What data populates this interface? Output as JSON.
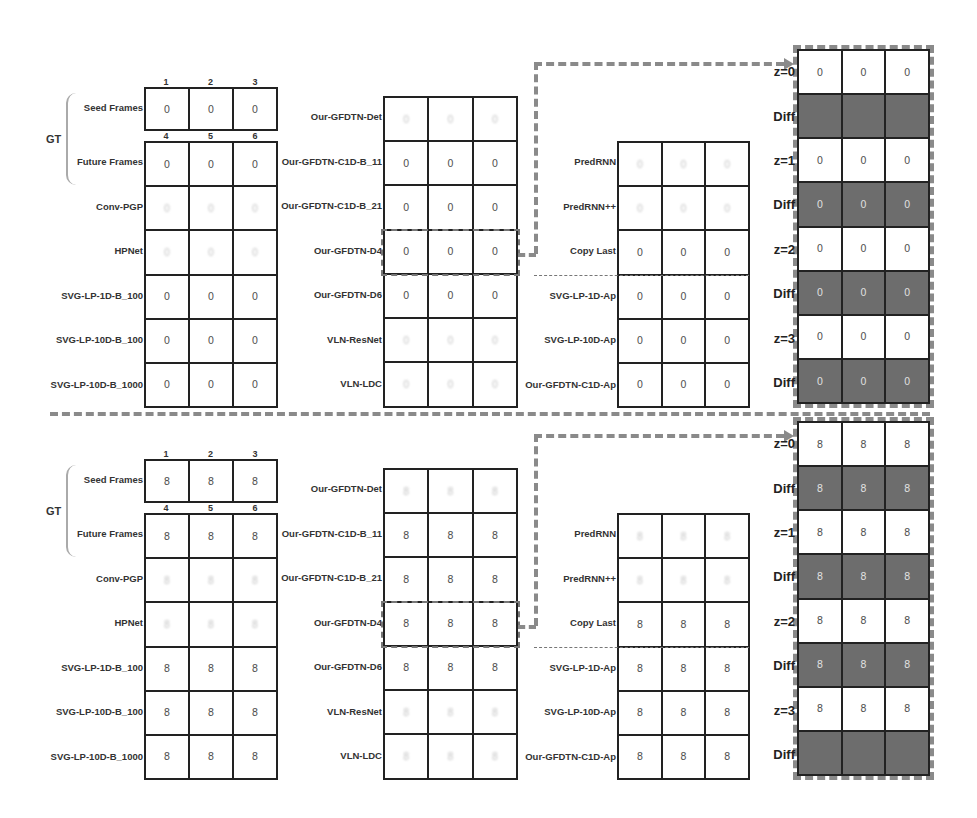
{
  "figure": {
    "column_numbers": {
      "seed": [
        "1",
        "2",
        "3"
      ],
      "future": [
        "4",
        "5",
        "6"
      ]
    },
    "gt_label": "GT",
    "accent_colors": {
      "grid_border": "#222222",
      "diff_cell": "#6d6d6d",
      "dashed": "#8a8a8a"
    }
  },
  "top_panel": {
    "digit": "0",
    "left_rows": [
      "Seed Frames",
      "Future Frames",
      "Conv-PGP",
      "HPNet",
      "SVG-LP-1D-B_100",
      "SVG-LP-10D-B_100",
      "SVG-LP-10D-B_1000"
    ],
    "middle_rows": [
      "Our-GFDTN-Det",
      "Our-GFDTN-C1D-B_11",
      "Our-GFDTN-C1D-B_21",
      "Our-GFDTN-D4",
      "Our-GFDTN-D6",
      "VLN-ResNet",
      "VLN-LDC"
    ],
    "right_rows": [
      "PredRNN",
      "PredRNN++",
      "Copy Last",
      "SVG-LP-1D-Ap",
      "SVG-LP-10D-Ap",
      "Our-GFDTN-C1D-Ap"
    ],
    "far_right_rows": [
      "z=0",
      "Diff",
      "z=1",
      "Diff",
      "z=2",
      "Diff",
      "z=3",
      "Diff"
    ]
  },
  "bottom_panel": {
    "digit": "8",
    "left_rows": [
      "Seed Frames",
      "Future Frames",
      "Conv-PGP",
      "HPNet",
      "SVG-LP-1D-B_100",
      "SVG-LP-10D-B_100",
      "SVG-LP-10D-B_1000"
    ],
    "middle_rows": [
      "Our-GFDTN-Det",
      "Our-GFDTN-C1D-B_11",
      "Our-GFDTN-C1D-B_21",
      "Our-GFDTN-D4",
      "Our-GFDTN-D6",
      "VLN-ResNet",
      "VLN-LDC"
    ],
    "right_rows": [
      "PredRNN",
      "PredRNN++",
      "Copy Last",
      "SVG-LP-1D-Ap",
      "SVG-LP-10D-Ap",
      "Our-GFDTN-C1D-Ap"
    ],
    "far_right_rows": [
      "z=0",
      "Diff",
      "z=1",
      "Diff",
      "z=2",
      "Diff",
      "z=3",
      "Diff"
    ]
  }
}
